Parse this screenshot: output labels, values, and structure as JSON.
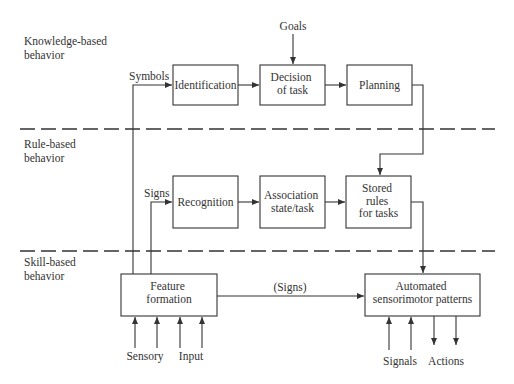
{
  "diagram": {
    "levels": [
      {
        "id": "knowledge",
        "lines": [
          "Knowledge-based",
          "behavior"
        ]
      },
      {
        "id": "rule",
        "lines": [
          "Rule-based",
          "behavior"
        ]
      },
      {
        "id": "skill",
        "lines": [
          "Skill-based",
          "behavior"
        ]
      }
    ],
    "boxes": {
      "identification": [
        "Identification"
      ],
      "decision": [
        "Decision",
        "of task"
      ],
      "planning": [
        "Planning"
      ],
      "recognition": [
        "Recognition"
      ],
      "association": [
        "Association",
        "state/task"
      ],
      "stored_rules": [
        "Stored",
        "rules",
        "for tasks"
      ],
      "feature_formation": [
        "Feature",
        "formation"
      ],
      "automated": [
        "Automated",
        "sensorimotor patterns"
      ]
    },
    "labels": {
      "goals": "Goals",
      "symbols": "Symbols",
      "signs": "Signs",
      "signs_paren": "(Signs)",
      "sensory": "Sensory",
      "input": "Input",
      "signals": "Signals",
      "actions": "Actions"
    }
  }
}
